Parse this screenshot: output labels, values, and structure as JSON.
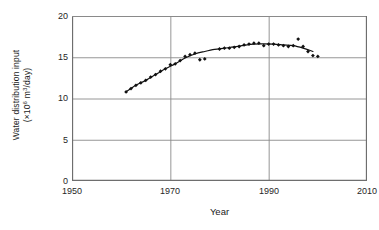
{
  "chart_data": {
    "type": "scatter",
    "title": "",
    "xlabel": "Year",
    "ylabel": "Water distribution input (×10⁶ m³/day)",
    "ylabel_line1": "Water distribution input",
    "ylabel_line2_pre": "(×10",
    "ylabel_line2_sup1": "6",
    "ylabel_line2_mid": " m",
    "ylabel_line2_sup2": "3",
    "ylabel_line2_post": "/day)",
    "xlim": [
      1950,
      2010
    ],
    "ylim": [
      0,
      20
    ],
    "xticks": [
      1950,
      1970,
      1990,
      2010
    ],
    "yticks": [
      0,
      5,
      10,
      15,
      20
    ],
    "grid": "horizontal-and-vertical-at-ticks",
    "legend": "none",
    "marker": "filled-diamond",
    "marker_color": "#111111",
    "trend_line_color": "#111111",
    "series": [
      {
        "name": "Water distribution input",
        "x": [
          1961,
          1962,
          1963,
          1964,
          1965,
          1966,
          1967,
          1968,
          1969,
          1970,
          1971,
          1972,
          1973,
          1974,
          1975,
          1976,
          1977,
          1980,
          1981,
          1982,
          1983,
          1984,
          1985,
          1986,
          1987,
          1988,
          1989,
          1990,
          1991,
          1992,
          1993,
          1994,
          1995,
          1996,
          1997,
          1998,
          1999,
          2000
        ],
        "values": [
          10.8,
          11.2,
          11.6,
          11.9,
          12.2,
          12.6,
          12.9,
          13.3,
          13.6,
          14.1,
          14.2,
          14.6,
          15.1,
          15.3,
          15.5,
          14.7,
          14.8,
          16.0,
          16.1,
          16.1,
          16.2,
          16.3,
          16.5,
          16.6,
          16.7,
          16.7,
          16.4,
          16.6,
          16.6,
          16.5,
          16.4,
          16.3,
          16.4,
          17.2,
          16.3,
          15.7,
          15.2,
          15.1
        ]
      }
    ],
    "trend_line": {
      "name": "smoothed trend",
      "x": [
        1961,
        1963,
        1965,
        1967,
        1969,
        1971,
        1973,
        1975,
        1977,
        1979,
        1981,
        1983,
        1985,
        1987,
        1989,
        1991,
        1993,
        1995,
        1997,
        1999
      ],
      "values": [
        10.8,
        11.6,
        12.2,
        12.9,
        13.6,
        14.2,
        14.9,
        15.4,
        15.7,
        15.95,
        16.1,
        16.25,
        16.45,
        16.6,
        16.62,
        16.6,
        16.5,
        16.4,
        16.1,
        15.7
      ]
    }
  },
  "axes": {
    "y_tick_labels": [
      "20",
      "15",
      "10",
      "5",
      "0"
    ],
    "x_tick_labels": [
      "1950",
      "1970",
      "1990",
      "2010"
    ]
  },
  "colors": {
    "axis": "#6e6e6e",
    "grid": "#8a8a8a",
    "data": "#111111",
    "background": "#ffffff"
  }
}
